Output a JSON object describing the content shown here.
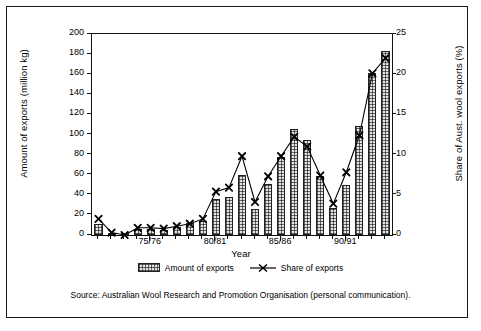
{
  "chart_data": {
    "type": "bar",
    "title": "",
    "xlabel": "Year",
    "ylabel": "Amount of exports (million kg)",
    "ylabel_right": "Share of Aust. wool exports (%)",
    "ylim": [
      0,
      200
    ],
    "ylim_right": [
      0,
      25
    ],
    "yticks": [
      0,
      20,
      40,
      60,
      80,
      100,
      120,
      140,
      160,
      180,
      200
    ],
    "yticks_right": [
      0,
      5,
      10,
      15,
      20,
      25
    ],
    "grid": false,
    "legend_position": "bottom",
    "categories": [
      "71/72",
      "72/73",
      "73/74",
      "74/75",
      "75/76",
      "76/77",
      "77/78",
      "78/79",
      "79/80",
      "80/81",
      "81/82",
      "82/83",
      "83/84",
      "84/85",
      "85/86",
      "86/87",
      "87/88",
      "88/89",
      "89/90",
      "90/91",
      "91/92",
      "92/93",
      "93/94"
    ],
    "xtick_labels": [
      "75/76",
      "80/81",
      "85/86",
      "90/91"
    ],
    "xtick_indices": [
      4,
      9,
      14,
      19
    ],
    "series": [
      {
        "name": "Amount of exports",
        "axis": "left",
        "unit": "million kg",
        "values": [
          11,
          2,
          1,
          6,
          6,
          5,
          8,
          12,
          14,
          36,
          38,
          60,
          26,
          51,
          78,
          105,
          95,
          59,
          27,
          50,
          108,
          161,
          183
        ]
      },
      {
        "name": "Share of exports",
        "axis": "right",
        "unit": "%",
        "values": [
          2.0,
          0.3,
          0.0,
          0.9,
          0.9,
          0.8,
          1.1,
          1.4,
          2.0,
          5.4,
          5.9,
          9.8,
          4.1,
          7.3,
          9.8,
          12.2,
          11.0,
          7.4,
          3.9,
          7.8,
          12.4,
          20.1,
          22.0
        ]
      }
    ]
  },
  "legend": {
    "bar_label": "Amount of exports",
    "line_label": "Share of exports"
  },
  "source": {
    "text": "Source: Australian Wool Research and Promotion Organisation (personal communication)."
  },
  "colors": {
    "axis": "#111111",
    "bar_fill": "#e3e3e3",
    "bar_edge": "#222222",
    "line": "#000000"
  }
}
